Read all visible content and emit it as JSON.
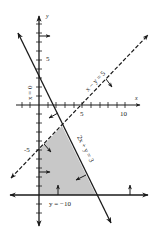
{
  "figure": {
    "type": "linear-inequality-graph",
    "axes": {
      "x_label": "x",
      "y_label": "y",
      "x_ticks": [
        "5",
        "10"
      ],
      "y_ticks": [
        "5",
        "-5"
      ]
    },
    "lines": [
      {
        "label": "x = 0",
        "style": "solid",
        "equation": "x = 0"
      },
      {
        "label": "x − y = 5",
        "style": "dashed",
        "equation": "x - y = 5"
      },
      {
        "label": "2x + y = 3",
        "style": "solid",
        "equation": "2x + y = 3"
      },
      {
        "label": "y = −10",
        "style": "solid",
        "equation": "y = -10"
      }
    ],
    "feasible_region": {
      "fill": "#c8c8c8",
      "vertices": [
        [
          0,
          -5
        ],
        [
          2.67,
          -2.33
        ],
        [
          6.5,
          -10
        ],
        [
          0,
          -10
        ]
      ]
    },
    "colors": {
      "line": "#1a1a1a",
      "shade": "#c8c8c8",
      "background": "#ffffff"
    }
  }
}
